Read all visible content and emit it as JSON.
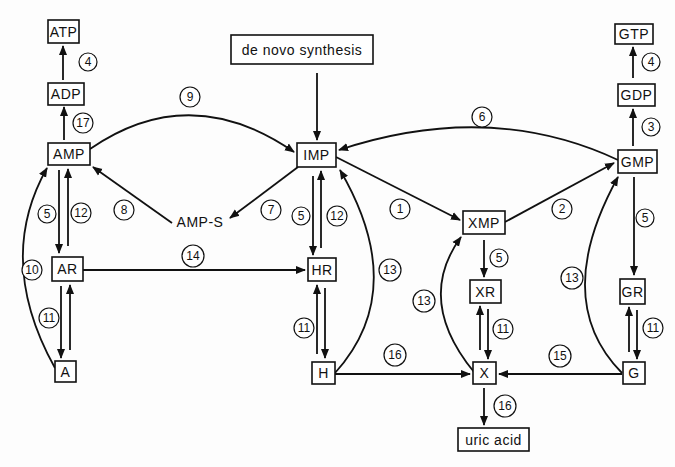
{
  "diagram": {
    "type": "metabolic-pathway",
    "nodes": {
      "atp": "ATP",
      "adp": "ADP",
      "amp": "AMP",
      "ar": "AR",
      "a": "A",
      "de_novo": "de novo synthesis",
      "imp": "IMP",
      "amp_s": "AMP-S",
      "hr": "HR",
      "h": "H",
      "xmp": "XMP",
      "xr": "XR",
      "x": "X",
      "uric_acid": "uric acid",
      "gtp": "GTP",
      "gdp": "GDP",
      "gmp": "GMP",
      "gr": "GR",
      "g": "G"
    },
    "edges": [
      {
        "from": "ADP",
        "to": "ATP",
        "enzyme": "4"
      },
      {
        "from": "AMP",
        "to": "ADP",
        "enzyme": "17"
      },
      {
        "from": "AMP",
        "to": "IMP",
        "enzyme": "9"
      },
      {
        "from": "AMP",
        "to": "AR",
        "enzyme": "5"
      },
      {
        "from": "AR",
        "to": "AMP",
        "enzyme": "12"
      },
      {
        "from": "AMP-S",
        "to": "AMP",
        "enzyme": "8"
      },
      {
        "from": "IMP",
        "to": "AMP-S",
        "enzyme": "7"
      },
      {
        "from": "A",
        "to": "AMP",
        "enzyme": "10"
      },
      {
        "from": "AR",
        "to": "A",
        "enzyme": "11"
      },
      {
        "from": "A",
        "to": "AR",
        "enzyme": "11"
      },
      {
        "from": "AR",
        "to": "HR",
        "enzyme": "14"
      },
      {
        "from": "de novo synthesis",
        "to": "IMP",
        "enzyme": ""
      },
      {
        "from": "IMP",
        "to": "HR",
        "enzyme": "5"
      },
      {
        "from": "HR",
        "to": "IMP",
        "enzyme": "12"
      },
      {
        "from": "HR",
        "to": "H",
        "enzyme": "11"
      },
      {
        "from": "H",
        "to": "HR",
        "enzyme": "11"
      },
      {
        "from": "H",
        "to": "IMP",
        "enzyme": "13"
      },
      {
        "from": "H",
        "to": "X",
        "enzyme": "16"
      },
      {
        "from": "IMP",
        "to": "XMP",
        "enzyme": "1"
      },
      {
        "from": "XMP",
        "to": "GMP",
        "enzyme": "2"
      },
      {
        "from": "GMP",
        "to": "IMP",
        "enzyme": "6"
      },
      {
        "from": "XMP",
        "to": "XR",
        "enzyme": "5"
      },
      {
        "from": "XR",
        "to": "X",
        "enzyme": "11"
      },
      {
        "from": "X",
        "to": "XR",
        "enzyme": "11"
      },
      {
        "from": "X",
        "to": "XMP",
        "enzyme": "13"
      },
      {
        "from": "X",
        "to": "uric acid",
        "enzyme": "16"
      },
      {
        "from": "GMP",
        "to": "GDP",
        "enzyme": "3"
      },
      {
        "from": "GDP",
        "to": "GTP",
        "enzyme": "4"
      },
      {
        "from": "GMP",
        "to": "GR",
        "enzyme": "5"
      },
      {
        "from": "GR",
        "to": "G",
        "enzyme": "11"
      },
      {
        "from": "G",
        "to": "GR",
        "enzyme": "11"
      },
      {
        "from": "G",
        "to": "GMP",
        "enzyme": "13"
      },
      {
        "from": "G",
        "to": "X",
        "enzyme": "15"
      }
    ],
    "labels": {
      "e4_left": "4",
      "e17": "17",
      "e9": "9",
      "e5_amp": "5",
      "e12_amp": "12",
      "e8": "8",
      "e7": "7",
      "e10": "10",
      "e11_ar": "11",
      "e14": "14",
      "e5_imp": "5",
      "e12_imp": "12",
      "e11_hr": "11",
      "e13_h": "13",
      "e16_h": "16",
      "e1": "1",
      "e2": "2",
      "e6": "6",
      "e5_xmp": "5",
      "e11_xr": "11",
      "e13_x": "13",
      "e16_x": "16",
      "e3": "3",
      "e4_right": "4",
      "e5_gmp": "5",
      "e11_gr": "11",
      "e13_g": "13",
      "e15": "15"
    }
  }
}
